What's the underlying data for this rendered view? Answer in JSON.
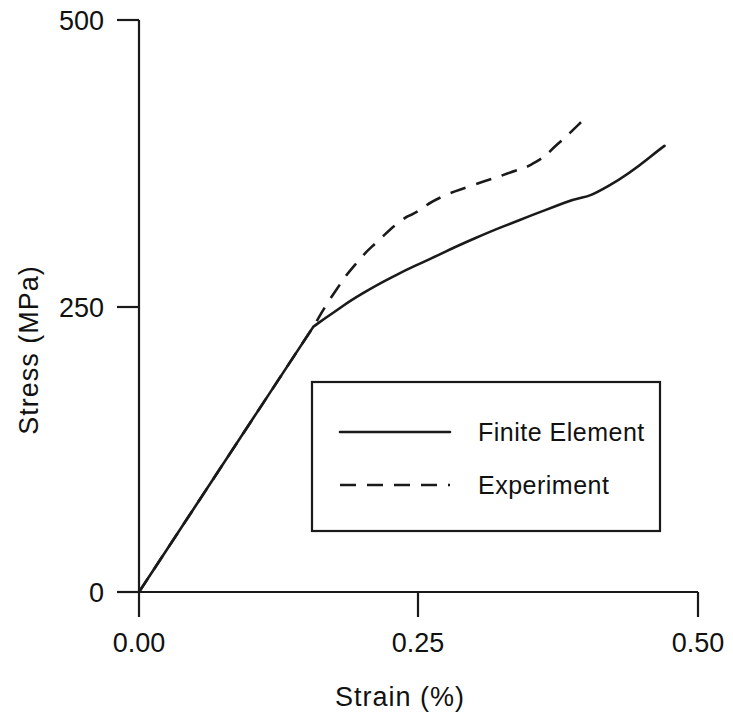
{
  "chart_data": {
    "type": "line",
    "title": "",
    "xlabel": "Strain (%)",
    "ylabel": "Stress (MPa)",
    "xlim": [
      0.0,
      0.5
    ],
    "ylim": [
      0,
      500
    ],
    "xticks": [
      "0.00",
      "0.25",
      "0.50"
    ],
    "xtick_values": [
      0.0,
      0.25,
      0.5
    ],
    "yticks": [
      "0",
      "250",
      "500"
    ],
    "ytick_values": [
      0,
      250,
      500
    ],
    "grid": false,
    "legend_position": "center-right-inside",
    "series": [
      {
        "name": "Finite Element",
        "style": "solid",
        "color": "#1a1a1a",
        "x": [
          0.0,
          0.156,
          0.175,
          0.2,
          0.23,
          0.26,
          0.3,
          0.34,
          0.38,
          0.42,
          0.47
        ],
        "y": [
          0,
          232,
          245,
          261,
          277,
          291,
          309,
          325,
          340,
          355,
          390
        ]
      },
      {
        "name": "Experiment",
        "style": "dashed",
        "color": "#1a1a1a",
        "x": [
          0.0,
          0.156,
          0.175,
          0.195,
          0.215,
          0.235,
          0.248,
          0.27,
          0.3,
          0.33,
          0.355,
          0.375,
          0.4
        ],
        "y": [
          0,
          232,
          262,
          288,
          308,
          325,
          332,
          345,
          356,
          366,
          376,
          392,
          415
        ]
      }
    ]
  },
  "axes": {
    "y_axis_title": "Stress (MPa)",
    "x_axis_title": "Strain (%)",
    "y_top_label": "500",
    "y_mid_label": "250",
    "y_bottom_label": "0",
    "x_left_label": "0.00",
    "x_mid_label": "0.25",
    "x_right_label": "0.50"
  },
  "legend": {
    "entries": [
      {
        "label": "Finite Element",
        "style": "solid"
      },
      {
        "label": "Experiment",
        "style": "dashed"
      }
    ]
  },
  "colors": {
    "ink": "#1a1a1a",
    "background": "#ffffff"
  }
}
